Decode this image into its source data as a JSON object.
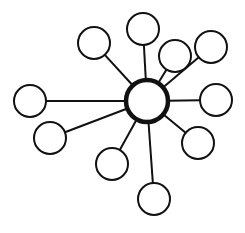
{
  "diagram": {
    "type": "hub-and-spoke",
    "width": 245,
    "height": 233,
    "background": "#ffffff",
    "stroke_color": "#111111",
    "hub": {
      "id": "hub",
      "cx": 147,
      "cy": 101,
      "r": 21,
      "stroke_width": 4.5
    },
    "spokes": [
      {
        "id": "node-left",
        "cx": 30,
        "cy": 101,
        "r": 16
      },
      {
        "id": "node-lower-left",
        "cx": 50,
        "cy": 138,
        "r": 16
      },
      {
        "id": "node-upper-left",
        "cx": 94,
        "cy": 43,
        "r": 16
      },
      {
        "id": "node-top",
        "cx": 143,
        "cy": 29,
        "r": 16
      },
      {
        "id": "node-upper-right-inner",
        "cx": 175,
        "cy": 56,
        "r": 16
      },
      {
        "id": "node-upper-right-outer",
        "cx": 211,
        "cy": 47,
        "r": 16
      },
      {
        "id": "node-right",
        "cx": 216,
        "cy": 100,
        "r": 16
      },
      {
        "id": "node-lower-right",
        "cx": 198,
        "cy": 143,
        "r": 16
      },
      {
        "id": "node-lower-middle",
        "cx": 112,
        "cy": 164,
        "r": 16
      },
      {
        "id": "node-bottom",
        "cx": 154,
        "cy": 199,
        "r": 16
      }
    ],
    "spoke_stroke_width": 2,
    "node_stroke_width": 2
  }
}
